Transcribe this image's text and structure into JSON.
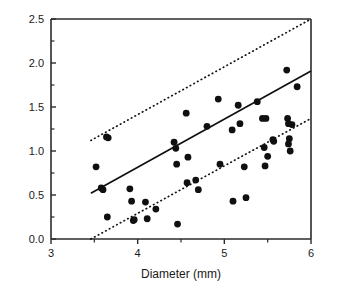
{
  "figure": {
    "width": 340,
    "height": 292,
    "background": "#ffffff",
    "ink_color": "#111111"
  },
  "axis": {
    "x_title": "Diameter  (mm)",
    "y_title": "",
    "x_tick_labels": [
      "3",
      "4",
      "5",
      "6"
    ],
    "y_tick_labels": [
      "0.0",
      "0.5",
      "1.0",
      "1.5",
      "2.0",
      "2.5"
    ],
    "x_minor_ticks": [
      3.5,
      4.5,
      5.5
    ],
    "y_minor_ticks": [
      0.25,
      0.75,
      1.25,
      1.75,
      2.25
    ]
  },
  "chart_data": {
    "type": "scatter",
    "title": "",
    "xlabel": "Diameter  (mm)",
    "ylabel": "",
    "xlim": [
      3,
      6
    ],
    "ylim": [
      0.0,
      2.5
    ],
    "xticks": [
      3,
      4,
      5,
      6
    ],
    "yticks": [
      0.0,
      0.5,
      1.0,
      1.5,
      2.0,
      2.5
    ],
    "grid": false,
    "legend": "none",
    "marker": "filled-circle",
    "marker_color": "#101010",
    "points": [
      [
        3.52,
        0.82
      ],
      [
        3.58,
        0.58
      ],
      [
        3.6,
        0.56
      ],
      [
        3.64,
        1.16
      ],
      [
        3.66,
        1.15
      ],
      [
        3.65,
        0.25
      ],
      [
        3.91,
        0.57
      ],
      [
        3.93,
        0.43
      ],
      [
        3.95,
        0.21
      ],
      [
        3.96,
        0.22
      ],
      [
        4.09,
        0.42
      ],
      [
        4.11,
        0.23
      ],
      [
        4.21,
        0.34
      ],
      [
        4.42,
        1.1
      ],
      [
        4.44,
        1.03
      ],
      [
        4.45,
        0.85
      ],
      [
        4.46,
        0.17
      ],
      [
        4.56,
        1.43
      ],
      [
        4.58,
        0.93
      ],
      [
        4.57,
        0.64
      ],
      [
        4.67,
        0.67
      ],
      [
        4.7,
        0.56
      ],
      [
        4.8,
        1.28
      ],
      [
        4.93,
        1.59
      ],
      [
        4.95,
        0.85
      ],
      [
        5.09,
        1.24
      ],
      [
        5.1,
        0.43
      ],
      [
        5.16,
        1.52
      ],
      [
        5.18,
        1.31
      ],
      [
        5.23,
        0.82
      ],
      [
        5.25,
        0.47
      ],
      [
        5.38,
        1.56
      ],
      [
        5.44,
        1.37
      ],
      [
        5.48,
        1.37
      ],
      [
        5.46,
        1.04
      ],
      [
        5.5,
        0.94
      ],
      [
        5.47,
        0.83
      ],
      [
        5.56,
        1.13
      ],
      [
        5.57,
        1.11
      ],
      [
        5.72,
        1.92
      ],
      [
        5.73,
        1.37
      ],
      [
        5.74,
        1.31
      ],
      [
        5.78,
        1.3
      ],
      [
        5.75,
        1.14
      ],
      [
        5.74,
        1.08
      ],
      [
        5.76,
        1.0
      ],
      [
        5.84,
        1.73
      ]
    ],
    "lines": [
      {
        "name": "regression-fit",
        "style": "solid",
        "x": [
          3.46,
          6.0
        ],
        "y": [
          0.52,
          1.91
        ]
      },
      {
        "name": "upper-prediction-bound",
        "style": "dotted",
        "x": [
          3.46,
          6.0
        ],
        "y": [
          1.12,
          2.5
        ]
      },
      {
        "name": "lower-prediction-bound",
        "style": "dotted",
        "x": [
          3.46,
          6.0
        ],
        "y": [
          0.0,
          1.37
        ]
      }
    ]
  }
}
